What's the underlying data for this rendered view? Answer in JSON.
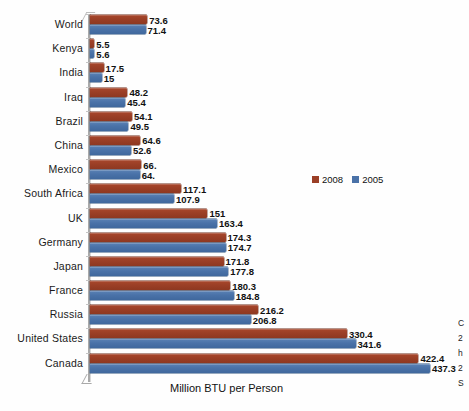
{
  "chart_data": {
    "type": "bar",
    "orientation": "horizontal",
    "title": "",
    "xlabel": "Million BTU per Person",
    "ylabel": "",
    "xlim": [
      0,
      437.3
    ],
    "grid": false,
    "legend_position": "middle-right",
    "categories": [
      "World",
      "Kenya",
      "India",
      "Iraq",
      "Brazil",
      "China",
      "Mexico",
      "South Africa",
      "UK",
      "Germany",
      "Japan",
      "France",
      "Russia",
      "United States",
      "Canada"
    ],
    "series": [
      {
        "name": "2008",
        "color": "#9b3f26",
        "values": [
          73.6,
          5.5,
          17.5,
          48.2,
          54.1,
          64.6,
          66.0,
          117.1,
          151,
          174.3,
          171.8,
          180.3,
          216.2,
          330.4,
          422.4
        ],
        "labels": [
          "73.6",
          "5.5",
          "17.5",
          "48.2",
          "54.1",
          "64.6",
          "66.",
          "117.1",
          "151",
          "174.3",
          "171.8",
          "180.3",
          "216.2",
          "330.4",
          "422.4"
        ]
      },
      {
        "name": "2005",
        "color": "#4a72a8",
        "values": [
          71.4,
          5.6,
          15,
          45.4,
          49.5,
          52.6,
          64.0,
          107.9,
          163.4,
          174.7,
          177.8,
          184.8,
          206.8,
          341.6,
          437.3
        ],
        "labels": [
          "71.4",
          "5.6",
          "15",
          "45.4",
          "49.5",
          "52.6",
          "64.",
          "107.9",
          "163.4",
          "174.7",
          "177.8",
          "184.8",
          "206.8",
          "341.6",
          "437.3"
        ]
      }
    ],
    "legend": [
      "2008",
      "2005"
    ],
    "side_note_lines": [
      "C",
      "2",
      "h",
      "2",
      "S"
    ]
  }
}
